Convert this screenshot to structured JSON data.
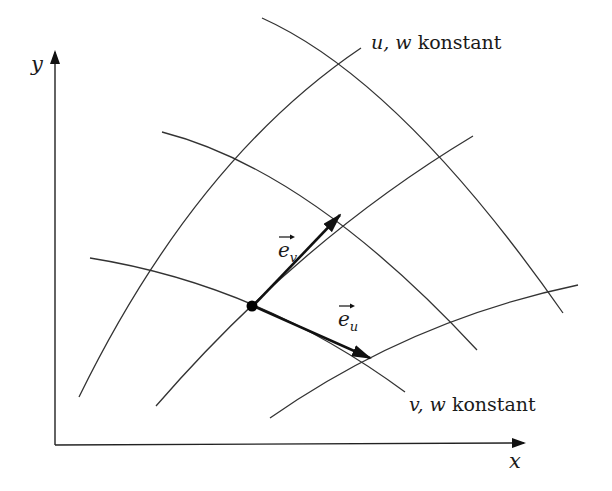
{
  "figure": {
    "axes": {
      "x_label": "x",
      "y_label": "y"
    },
    "curve_labels": {
      "u_w_const": "u, w konstant",
      "u_w_const_vars": "u, w",
      "u_w_const_word": "konstant",
      "v_w_const": "v, w konstant",
      "v_w_const_vars": "v, w",
      "v_w_const_word": "konstant"
    },
    "vectors": {
      "e_v": {
        "base": "e",
        "subscript": "v"
      },
      "e_u": {
        "base": "e",
        "subscript": "u"
      }
    },
    "colors": {
      "background": "#ffffff",
      "line": "#333333",
      "ink": "#111111"
    }
  }
}
